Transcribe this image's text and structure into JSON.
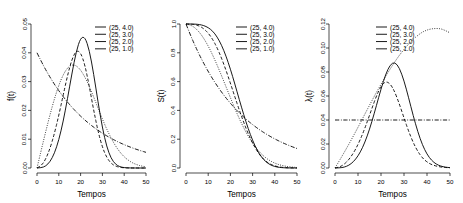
{
  "figure": {
    "panel_count": 3,
    "panels": [
      {
        "id": "density",
        "ylabel": "f(t)",
        "xlabel": "Tempos",
        "xticks": [
          "0",
          "10",
          "20",
          "30",
          "40",
          "50"
        ],
        "yticks": [
          "0.00",
          "0.01",
          "0.02",
          "0.03",
          "0.04",
          "0.05"
        ],
        "legend": [
          {
            "label": "(25, 4.0)",
            "style": "solid"
          },
          {
            "label": "(25, 3.0)",
            "style": "dashed"
          },
          {
            "label": "(25, 2.0)",
            "style": "dotted"
          },
          {
            "label": "(25, 1.0)",
            "style": "dashdot"
          }
        ]
      },
      {
        "id": "survival",
        "ylabel": "S(t)",
        "xlabel": "Tempos",
        "xticks": [
          "0",
          "10",
          "20",
          "30",
          "40",
          "50"
        ],
        "yticks": [
          "0.0",
          "0.2",
          "0.4",
          "0.6",
          "0.8",
          "1.0"
        ],
        "legend": [
          {
            "label": "(25, 4.0)",
            "style": "solid"
          },
          {
            "label": "(25, 3.0)",
            "style": "dashed"
          },
          {
            "label": "(25, 2.0)",
            "style": "dotted"
          },
          {
            "label": "(25, 1.0)",
            "style": "dashdot"
          }
        ]
      },
      {
        "id": "hazard",
        "ylabel": "λ(t)",
        "xlabel": "Tempos",
        "xticks": [
          "0",
          "10",
          "20",
          "30",
          "40",
          "50"
        ],
        "yticks": [
          "0.00",
          "0.02",
          "0.04",
          "0.06",
          "0.08",
          "0.10",
          "0.12"
        ],
        "legend": [
          {
            "label": "(25, 4.0)",
            "style": "solid"
          },
          {
            "label": "(25, 3.0)",
            "style": "dashed"
          },
          {
            "label": "(25, 2.0)",
            "style": "dotted"
          },
          {
            "label": "(25, 1.0)",
            "style": "dashdot"
          }
        ]
      }
    ]
  },
  "chart_data": [
    {
      "type": "line",
      "title": "",
      "xlabel": "Tempos",
      "ylabel": "f(t)",
      "xlim": [
        0,
        50
      ],
      "ylim": [
        0.0,
        0.05
      ],
      "grid": false,
      "legend_position": "top-right",
      "xticks": [
        0,
        10,
        20,
        30,
        40,
        50
      ],
      "yticks": [
        0.0,
        0.01,
        0.02,
        0.03,
        0.04,
        0.05
      ],
      "x": [
        0,
        2,
        4,
        6,
        8,
        10,
        12,
        14,
        16,
        18,
        20,
        22,
        24,
        26,
        28,
        30,
        32,
        34,
        36,
        38,
        40,
        42,
        44,
        46,
        48,
        50
      ],
      "series": [
        {
          "name": "(25, 4.0)",
          "style": "solid",
          "values": [
            0.0,
            8e-05,
            0.00065,
            0.00218,
            0.00508,
            0.00968,
            0.0161,
            0.02409,
            0.03275,
            0.04045,
            0.04524,
            0.04552,
            0.04095,
            0.03266,
            0.02286,
            0.01394,
            0.00733,
            0.00331,
            0.00128,
            0.00042,
            0.00012,
            3e-05,
            1e-05,
            0.0,
            0.0,
            0.0
          ]
        },
        {
          "name": "(25, 3.0)",
          "style": "dashed",
          "values": [
            0.0,
            0.00077,
            0.00306,
            0.00684,
            0.01199,
            0.01828,
            0.02525,
            0.03212,
            0.03773,
            0.04078,
            0.0402,
            0.03572,
            0.02829,
            0.02005,
            0.01271,
            0.00718,
            0.0036,
            0.0016,
            0.00063,
            0.00022,
            7e-05,
            2e-05,
            0.0,
            0.0,
            0.0,
            0.0
          ]
        },
        {
          "name": "(25, 2.0)",
          "style": "dotted",
          "values": [
            0.0,
            0.00639,
            0.01265,
            0.01862,
            0.02407,
            0.02875,
            0.03239,
            0.0348,
            0.03586,
            0.03557,
            0.03406,
            0.03156,
            0.02833,
            0.02465,
            0.0208,
            0.017,
            0.01347,
            0.01034,
            0.00768,
            0.00554,
            0.00386,
            0.00261,
            0.00171,
            0.00109,
            0.00067,
            0.0004
          ]
        },
        {
          "name": "(25, 1.0)",
          "style": "dashdot",
          "values": [
            0.04,
            0.03693,
            0.0341,
            0.03148,
            0.02906,
            0.02683,
            0.02477,
            0.02287,
            0.02112,
            0.0195,
            0.018,
            0.01662,
            0.01534,
            0.01417,
            0.01308,
            0.01208,
            0.01115,
            0.01029,
            0.0095,
            0.00878,
            0.0081,
            0.00748,
            0.00691,
            0.00638,
            0.00589,
            0.00544
          ]
        }
      ]
    },
    {
      "type": "line",
      "title": "",
      "xlabel": "Tempos",
      "ylabel": "S(t)",
      "xlim": [
        0,
        50
      ],
      "ylim": [
        0.0,
        1.0
      ],
      "grid": false,
      "legend_position": "top-right",
      "xticks": [
        0,
        10,
        20,
        30,
        40,
        50
      ],
      "yticks": [
        0.0,
        0.2,
        0.4,
        0.6,
        0.8,
        1.0
      ],
      "x": [
        0,
        2,
        4,
        6,
        8,
        10,
        12,
        14,
        16,
        18,
        20,
        22,
        24,
        26,
        28,
        30,
        32,
        34,
        36,
        38,
        40,
        42,
        44,
        46,
        48,
        50
      ],
      "series": [
        {
          "name": "(25, 4.0)",
          "style": "solid",
          "values": [
            1.0,
            1.0,
            0.99935,
            0.99668,
            0.98958,
            0.97533,
            0.95137,
            0.91121,
            0.85398,
            0.7788,
            0.68729,
            0.58364,
            0.4751,
            0.3697,
            0.27371,
            0.19131,
            0.12508,
            0.07597,
            0.04248,
            0.0217,
            0.01005,
            0.00419,
            0.00157,
            0.00052,
            0.00015,
            4e-05
          ]
        },
        {
          "name": "(25, 3.0)",
          "style": "dashed",
          "values": [
            1.0,
            0.99949,
            0.99591,
            0.98627,
            0.96766,
            0.93761,
            0.89384,
            0.83553,
            0.76338,
            0.67979,
            0.5886,
            0.4945,
            0.40229,
            0.31601,
            0.2387,
            0.17204,
            0.11738,
            0.07562,
            0.04585,
            0.02625,
            0.01411,
            0.00709,
            0.00332,
            0.00144,
            0.00058,
            0.00021
          ]
        },
        {
          "name": "(25, 2.0)",
          "style": "dotted",
          "values": [
            1.0,
            0.99361,
            0.97456,
            0.94355,
            0.90074,
            0.84729,
            0.78491,
            0.71559,
            0.64153,
            0.56503,
            0.48827,
            0.41307,
            0.34301,
            0.27865,
            0.22122,
            0.17204,
            0.13041,
            0.09633,
            0.06948,
            0.04889,
            0.03356,
            0.0225,
            0.01471,
            0.00939,
            0.00585,
            0.00355
          ]
        },
        {
          "name": "(25, 1.0)",
          "style": "dashdot",
          "values": [
            1.0,
            0.92312,
            0.85214,
            0.78663,
            0.72615,
            0.67032,
            0.61878,
            0.57121,
            0.52729,
            0.48675,
            0.44933,
            0.41478,
            0.38289,
            0.35345,
            0.32628,
            0.30119,
            0.27804,
            0.25666,
            0.23693,
            0.21871,
            0.2019,
            0.18637,
            0.17204,
            0.15882,
            0.14661,
            0.13534
          ]
        }
      ]
    },
    {
      "type": "line",
      "title": "",
      "xlabel": "Tempos",
      "ylabel": "λ(t)",
      "xlim": [
        0,
        50
      ],
      "ylim": [
        0.0,
        0.12
      ],
      "grid": false,
      "legend_position": "top-right",
      "xticks": [
        0,
        10,
        20,
        30,
        40,
        50
      ],
      "yticks": [
        0.0,
        0.02,
        0.04,
        0.06,
        0.08,
        0.1,
        0.12
      ],
      "x": [
        0,
        2,
        4,
        6,
        8,
        10,
        12,
        14,
        16,
        18,
        20,
        22,
        24,
        26,
        28,
        30,
        32,
        34,
        36,
        38,
        40,
        42,
        44,
        46,
        48,
        50
      ],
      "series": [
        {
          "name": "(25, 4.0)",
          "style": "solid",
          "values": [
            0.0,
            8e-05,
            0.00066,
            0.00219,
            0.00513,
            0.00992,
            0.01693,
            0.02644,
            0.03835,
            0.05194,
            0.06584,
            0.07798,
            0.08619,
            0.08836,
            0.08352,
            0.07283,
            0.05862,
            0.0436,
            0.0301,
            0.01926,
            0.01142,
            0.00628,
            0.00321,
            0.00153,
            0.00068,
            0.00029
          ]
        },
        {
          "name": "(25, 3.0)",
          "style": "dashed",
          "values": [
            0.0,
            0.00077,
            0.00307,
            0.00693,
            0.01239,
            0.0195,
            0.02825,
            0.03844,
            0.04943,
            0.05999,
            0.0683,
            0.07223,
            0.07032,
            0.06344,
            0.05325,
            0.04173,
            0.03067,
            0.02116,
            0.01374,
            0.00838,
            0.00496,
            0.00282,
            0.00159,
            0.00083,
            0.00042,
            0.0002
          ]
        },
        {
          "name": "(25, 2.0)",
          "style": "dotted",
          "values": [
            0.0,
            0.0064,
            0.01298,
            0.01974,
            0.02673,
            0.03393,
            0.04127,
            0.04863,
            0.0559,
            0.06295,
            0.06976,
            0.0764,
            0.08259,
            0.08846,
            0.09402,
            0.09881,
            0.10329,
            0.10733,
            0.11053,
            0.11331,
            0.11501,
            0.116,
            0.11632,
            0.11608,
            0.11453,
            0.11264
          ]
        },
        {
          "name": "(25, 1.0)",
          "style": "dashdot",
          "values": [
            0.04,
            0.04,
            0.04,
            0.04,
            0.04,
            0.04,
            0.04,
            0.04,
            0.04,
            0.04,
            0.04,
            0.04,
            0.04,
            0.04,
            0.04,
            0.04,
            0.04,
            0.04,
            0.04,
            0.04,
            0.04,
            0.04,
            0.04,
            0.04,
            0.04,
            0.04
          ]
        }
      ]
    }
  ]
}
